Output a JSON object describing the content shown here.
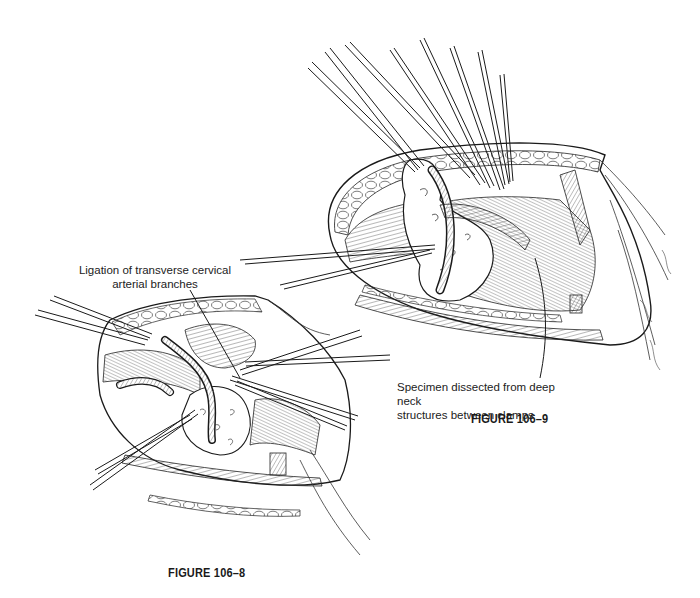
{
  "figures": [
    {
      "id": "figure-106-9",
      "caption": "FIGURE 106–9",
      "annotation": {
        "line1": "Specimen dissected from deep neck",
        "line2": "structures between clamps"
      }
    },
    {
      "id": "figure-106-8",
      "caption": "FIGURE 106–8",
      "annotation": {
        "line1": "Ligation of transverse cervical",
        "line2": "arterial branches"
      }
    }
  ],
  "style": {
    "ink_color": "#1a1a1a",
    "background": "#ffffff"
  }
}
